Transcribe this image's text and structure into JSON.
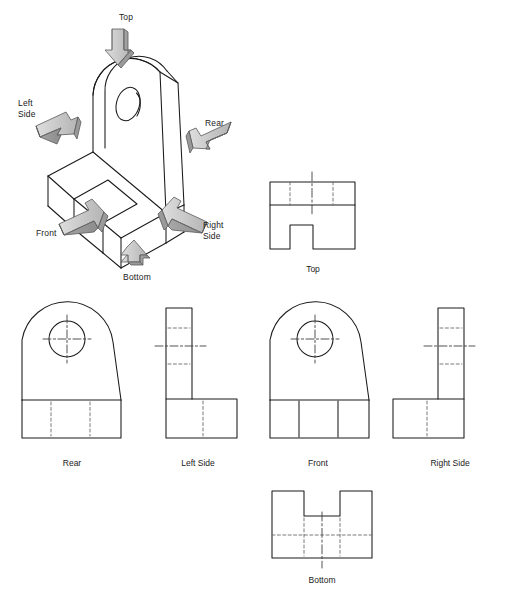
{
  "document": {
    "kind": "orthographic-projection-figure",
    "background_color": "#ffffff",
    "line_color": "#1a1a1a",
    "hidden_line_color": "#6b6b6b",
    "center_line_color": "#4a4a4a",
    "arrow_fill": "#b8b8b8",
    "arrow_fill_dark": "#8f8f8f",
    "arrow_fill_light": "#d8d8d8",
    "arrow_stroke": "#555555"
  },
  "isometric": {
    "name": "isometric-pictorial",
    "direction_labels": [
      {
        "key": "top",
        "text": "Top",
        "x": 126,
        "y": 12,
        "align": "center"
      },
      {
        "key": "left_side",
        "text": "Left\nSide",
        "x": 18,
        "y": 98,
        "align": "left"
      },
      {
        "key": "rear",
        "text": "Rear",
        "x": 205,
        "y": 118,
        "align": "left"
      },
      {
        "key": "front",
        "text": "Front",
        "x": 36,
        "y": 228,
        "align": "left"
      },
      {
        "key": "right_side",
        "text": "Right\nSide",
        "x": 203,
        "y": 220,
        "align": "left"
      },
      {
        "key": "bottom",
        "text": "Bottom",
        "x": 137,
        "y": 272,
        "align": "center"
      }
    ]
  },
  "views": [
    {
      "key": "top",
      "caption": "Top",
      "caption_x": 313,
      "caption_y": 264,
      "description": "Top view: rectangle with notch cut in lower edge, hidden lines for tab, vertical centerline"
    },
    {
      "key": "rear",
      "caption": "Rear",
      "caption_x": 72,
      "caption_y": 458,
      "description": "Rear view: rounded tab with circular hole and center mark, base band with hidden vertical lines"
    },
    {
      "key": "left_side",
      "caption": "Left Side",
      "caption_x": 198,
      "caption_y": 458,
      "description": "Left side view: L shape with vertical tab on left, hidden hole lines and horizontal centerline"
    },
    {
      "key": "front",
      "caption": "Front",
      "caption_x": 318,
      "caption_y": 458,
      "description": "Front view: rounded tab with circular hole and center mark, base band with visible vertical lines"
    },
    {
      "key": "right_side",
      "caption": "Right Side",
      "caption_x": 450,
      "caption_y": 458,
      "description": "Right side view: L shape with vertical tab on right, hidden hole lines and horizontal centerline"
    },
    {
      "key": "bottom",
      "caption": "Bottom",
      "caption_x": 322,
      "caption_y": 575,
      "description": "Bottom view: rectangle with notch cut in upper edge, hidden lines, vertical centerline"
    }
  ]
}
